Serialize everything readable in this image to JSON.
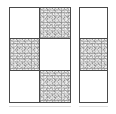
{
  "figure": {
    "background_color": "#ffffff",
    "border_color": "#4a4a4a",
    "white_fill_color": "#ffffff",
    "noise_fill_color": "#e6e6e6",
    "panels": [
      {
        "id": "left-panel",
        "label": "Left grid",
        "columns": 2,
        "rows": 3,
        "cells": [
          {
            "row": 1,
            "col": 1,
            "fill": "white"
          },
          {
            "row": 1,
            "col": 2,
            "fill": "noise"
          },
          {
            "row": 2,
            "col": 1,
            "fill": "noise"
          },
          {
            "row": 2,
            "col": 2,
            "fill": "white"
          },
          {
            "row": 3,
            "col": 1,
            "fill": "white"
          },
          {
            "row": 3,
            "col": 2,
            "fill": "noise"
          }
        ]
      },
      {
        "id": "right-panel",
        "label": "Right column",
        "columns": 1,
        "rows": 3,
        "cells": [
          {
            "row": 1,
            "col": 1,
            "fill": "white"
          },
          {
            "row": 2,
            "col": 1,
            "fill": "noise"
          },
          {
            "row": 3,
            "col": 1,
            "fill": "white"
          }
        ]
      }
    ]
  }
}
